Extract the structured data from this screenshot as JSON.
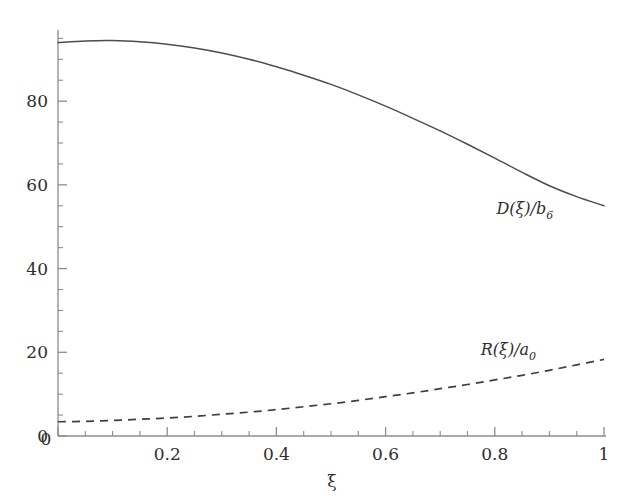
{
  "chart_data": {
    "type": "line",
    "title": "",
    "xlabel": "ξ",
    "ylabel": "",
    "xlim": [
      0,
      1
    ],
    "ylim": [
      0,
      97
    ],
    "grid": false,
    "legend_position": "inline-annotation",
    "x_ticks": [
      0,
      0.2,
      0.4,
      0.6,
      0.8,
      1
    ],
    "x_tick_labels": [
      "0",
      "0.2",
      "0.4",
      "0.6",
      "0.8",
      "1"
    ],
    "x_minor_tick_step": 0.05,
    "y_ticks": [
      0,
      20,
      40,
      60,
      80
    ],
    "y_tick_labels": [
      "0",
      "20",
      "40",
      "60",
      "80"
    ],
    "y_minor_tick_step": 5,
    "x": [
      0,
      0.05,
      0.1,
      0.15,
      0.2,
      0.25,
      0.3,
      0.35,
      0.4,
      0.45,
      0.5,
      0.55,
      0.6,
      0.65,
      0.7,
      0.75,
      0.8,
      0.85,
      0.9,
      0.95,
      1
    ],
    "series": [
      {
        "name": "D(ξ)/b_6",
        "label": "D(ξ)/b",
        "label_sub": "6",
        "style": "solid",
        "color": "#4d4d4d",
        "values": [
          94.0,
          94.4,
          94.5,
          94.2,
          93.6,
          92.7,
          91.5,
          90.0,
          88.2,
          86.2,
          84.0,
          81.5,
          78.8,
          75.9,
          72.9,
          69.7,
          66.4,
          63.0,
          59.8,
          57.2,
          55.0
        ]
      },
      {
        "name": "R(ξ)/a_0",
        "label": "R(ξ)/a",
        "label_sub": "0",
        "style": "dashed",
        "color": "#3f3f3f",
        "values": [
          3.4,
          3.5,
          3.7,
          4.0,
          4.3,
          4.7,
          5.2,
          5.7,
          6.3,
          7.0,
          7.7,
          8.5,
          9.4,
          10.3,
          11.3,
          12.3,
          13.4,
          14.5,
          15.7,
          17.0,
          18.3
        ]
      }
    ],
    "annotations": [
      {
        "name": "solid-curve-label",
        "text": "D(ξ)/b",
        "subscript": "6",
        "x_data": 0.855,
        "y_data": 53.0
      },
      {
        "name": "dashed-curve-label",
        "text": "R(ξ)/a",
        "subscript": "0",
        "x_data": 0.825,
        "y_data": 19.3
      }
    ]
  },
  "axes": {
    "x_title": "ξ",
    "y_title": ""
  },
  "colors": {
    "background": "#ffffff",
    "axis": "#8c8c8c",
    "solid_curve": "#4d4d4d",
    "dashed_curve": "#3f3f3f",
    "text": "#2e2e2e"
  }
}
